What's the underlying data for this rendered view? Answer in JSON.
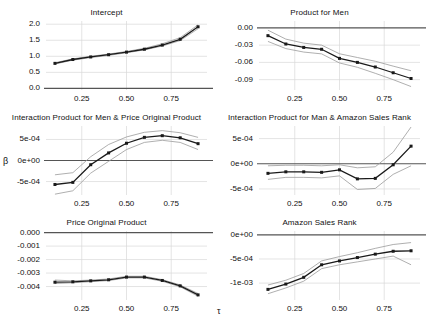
{
  "figure": {
    "xlabel": "τ",
    "ylabel": "β",
    "xticks": [
      "0.25",
      "0.50",
      "0.75"
    ],
    "xtick_values": [
      0.25,
      0.5,
      0.75
    ],
    "xlim": [
      0.05,
      0.95
    ],
    "colors": {
      "line": "#1a1a1a",
      "band": "#9a9a9a",
      "zero": "#555555",
      "grid": "#d9d9d9",
      "background": "#ffffff"
    }
  },
  "chart_data": [
    {
      "type": "line",
      "title": "Intercept",
      "xlabel": "τ",
      "ylabel": "β",
      "x": [
        0.1,
        0.2,
        0.3,
        0.4,
        0.5,
        0.6,
        0.7,
        0.8,
        0.9
      ],
      "yticks": [
        "0.0",
        "0.5",
        "1.0",
        "1.5",
        "2.0"
      ],
      "ytick_values": [
        0.0,
        0.5,
        1.0,
        1.5,
        2.0
      ],
      "ylim": [
        -0.05,
        2.1
      ],
      "zero_line": 0.0,
      "grid": true,
      "legend": "none",
      "series": [
        {
          "name": "estimate",
          "values": [
            0.78,
            0.9,
            0.98,
            1.05,
            1.13,
            1.22,
            1.35,
            1.53,
            1.92
          ]
        },
        {
          "name": "ci_lower",
          "values": [
            0.76,
            0.88,
            0.96,
            1.03,
            1.11,
            1.2,
            1.32,
            1.49,
            1.86
          ]
        },
        {
          "name": "ci_upper",
          "values": [
            0.8,
            0.92,
            1.0,
            1.07,
            1.15,
            1.25,
            1.39,
            1.58,
            1.98
          ]
        }
      ]
    },
    {
      "type": "line",
      "title": "Product for Men",
      "xlabel": "τ",
      "ylabel": "β",
      "x": [
        0.1,
        0.2,
        0.3,
        0.4,
        0.5,
        0.6,
        0.7,
        0.8,
        0.9
      ],
      "yticks": [
        "0.00",
        "-0.03",
        "-0.06",
        "-0.09"
      ],
      "ytick_values": [
        0.0,
        -0.03,
        -0.06,
        -0.09
      ],
      "ylim": [
        -0.108,
        0.012
      ],
      "zero_line": 0.0,
      "grid": true,
      "legend": "none",
      "series": [
        {
          "name": "estimate",
          "values": [
            -0.0135,
            -0.028,
            -0.034,
            -0.0372,
            -0.053,
            -0.06,
            -0.068,
            -0.078,
            -0.088
          ]
        },
        {
          "name": "ci_lower",
          "values": [
            -0.0235,
            -0.036,
            -0.042,
            -0.0452,
            -0.061,
            -0.0685,
            -0.079,
            -0.09,
            -0.102
          ]
        },
        {
          "name": "ci_upper",
          "values": [
            -0.004,
            -0.0195,
            -0.0265,
            -0.03,
            -0.045,
            -0.0515,
            -0.058,
            -0.0665,
            -0.0745
          ]
        }
      ]
    },
    {
      "type": "line",
      "title": "Interaction Product for Men & Price Original Product",
      "xlabel": "τ",
      "ylabel": "β",
      "x": [
        0.1,
        0.2,
        0.3,
        0.4,
        0.5,
        0.6,
        0.7,
        0.8,
        0.9
      ],
      "yticks": [
        "5e-04",
        "0e+00",
        "-5e-04"
      ],
      "ytick_values": [
        0.0005,
        0.0,
        -0.0005
      ],
      "ylim": [
        -0.00082,
        0.00082
      ],
      "zero_line": 0.0,
      "grid": true,
      "legend": "none",
      "series": [
        {
          "name": "estimate",
          "values": [
            -0.00057,
            -0.00052,
            -0.0001,
            0.00018,
            0.00041,
            0.00055,
            0.00059,
            0.00054,
            0.0004
          ]
        },
        {
          "name": "ci_lower",
          "values": [
            -0.0008,
            -0.00072,
            -0.0003,
            -2e-05,
            0.00026,
            0.00043,
            0.00048,
            0.00043,
            0.00026
          ]
        },
        {
          "name": "ci_upper",
          "values": [
            -0.00034,
            -0.00029,
            9e-05,
            0.00038,
            0.00056,
            0.00067,
            0.00071,
            0.00066,
            0.00055
          ]
        }
      ]
    },
    {
      "type": "line",
      "title": "Interaction Product for Man & Amazon Sales Rank",
      "xlabel": "τ",
      "ylabel": "β",
      "x": [
        0.1,
        0.2,
        0.3,
        0.4,
        0.5,
        0.6,
        0.7,
        0.8,
        0.9
      ],
      "yticks": [
        "5e-04",
        "0e+00",
        "-5e-04"
      ],
      "ytick_values": [
        0.0005,
        0.0,
        -0.0005
      ],
      "ylim": [
        -0.00062,
        0.00075
      ],
      "zero_line": 0.0,
      "grid": true,
      "legend": "none",
      "series": [
        {
          "name": "estimate",
          "values": [
            -0.00019,
            -0.00016,
            -0.00016,
            -0.00017,
            -0.00012,
            -0.0003,
            -0.00029,
            -2e-05,
            0.00035
          ]
        },
        {
          "name": "ci_lower",
          "values": [
            -0.00031,
            -0.00027,
            -0.00027,
            -0.00028,
            -0.00024,
            -0.00051,
            -0.00049,
            -0.00021,
            -4e-05
          ]
        },
        {
          "name": "ci_upper",
          "values": [
            -4e-05,
            -3e-05,
            -3e-05,
            -4e-05,
            -2e-05,
            -8e-05,
            -6e-05,
            0.00023,
            0.00073
          ]
        }
      ]
    },
    {
      "type": "line",
      "title": "Price Original Product",
      "xlabel": "τ",
      "ylabel": "β",
      "x": [
        0.1,
        0.2,
        0.3,
        0.4,
        0.5,
        0.6,
        0.7,
        0.8,
        0.9
      ],
      "yticks": [
        "0.000",
        "-0.001",
        "-0.002",
        "-0.003",
        "-0.004"
      ],
      "ytick_values": [
        0.0,
        -0.001,
        -0.002,
        -0.003,
        -0.004
      ],
      "ylim": [
        -0.005,
        0.00012
      ],
      "zero_line": 0.0,
      "grid": true,
      "legend": "none",
      "series": [
        {
          "name": "estimate",
          "values": [
            -0.00368,
            -0.00365,
            -0.00358,
            -0.0035,
            -0.0033,
            -0.0033,
            -0.00355,
            -0.00395,
            -0.00462
          ]
        },
        {
          "name": "ci_lower",
          "values": [
            -0.00378,
            -0.00372,
            -0.00364,
            -0.00356,
            -0.00336,
            -0.00336,
            -0.00361,
            -0.00402,
            -0.00472
          ]
        },
        {
          "name": "ci_upper",
          "values": [
            -0.00352,
            -0.00358,
            -0.00352,
            -0.00344,
            -0.00324,
            -0.00324,
            -0.00349,
            -0.00388,
            -0.00452
          ]
        }
      ]
    },
    {
      "type": "line",
      "title": "Amazon Sales Rank",
      "xlabel": "τ",
      "ylabel": "β",
      "x": [
        0.1,
        0.2,
        0.3,
        0.4,
        0.5,
        0.6,
        0.7,
        0.8,
        0.9
      ],
      "yticks": [
        "0e+00",
        "-5e-04",
        "-1e-03"
      ],
      "ytick_values": [
        0.0,
        -0.0005,
        -0.001
      ],
      "ylim": [
        -0.00135,
        8e-05
      ],
      "zero_line": 0.0,
      "grid": true,
      "legend": "none",
      "series": [
        {
          "name": "estimate",
          "values": [
            -0.00113,
            -0.00102,
            -0.00088,
            -0.00062,
            -0.00054,
            -0.00047,
            -0.0004,
            -0.00034,
            -0.00033
          ]
        },
        {
          "name": "ci_lower",
          "values": [
            -0.00122,
            -0.0011,
            -0.00096,
            -0.0007,
            -0.00062,
            -0.00056,
            -0.0005,
            -0.00044,
            -0.00062
          ]
        },
        {
          "name": "ci_upper",
          "values": [
            -0.00104,
            -0.00094,
            -0.0008,
            -0.00054,
            -0.00045,
            -0.00037,
            -0.00028,
            -0.0002,
            -0.00016
          ]
        }
      ]
    }
  ]
}
